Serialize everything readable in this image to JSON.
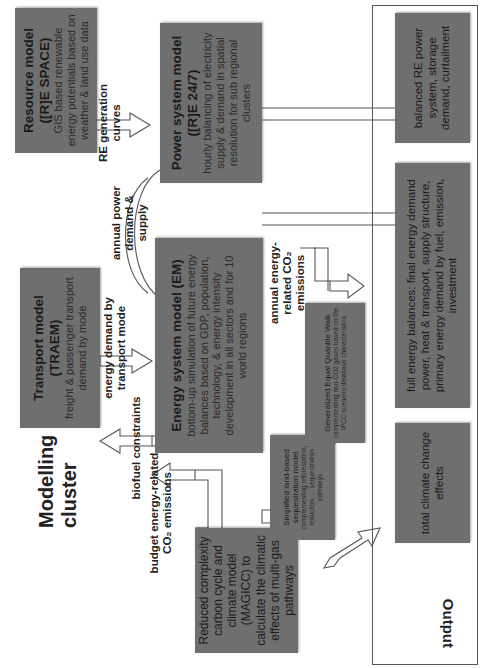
{
  "diagram": {
    "cluster_title": "Modelling cluster",
    "output_label": "Output",
    "models": {
      "resource": {
        "title": "Resource model ([R]E SPACE)",
        "desc": "GIS based renewable energy potentials based on weather & land use data"
      },
      "power": {
        "title": "Power system model ([R]E 24/7)",
        "desc": "hourly balancing of electricity supply & demand in spatial resolution for sub regional clusters"
      },
      "transport": {
        "title": "Transport model (TRAEM)",
        "desc": "freight & passenger transport demand by mode"
      },
      "energy": {
        "title": "Energy system model (EM)",
        "desc": "bottom-up simulation of future energy balances based on GDP, population, technology, & energy intensity development in all sectors and for 10 world regions"
      },
      "magicc": {
        "title": "",
        "desc": "Reduced complexity carbon cycle and climate model (MAGICC) to calculate the climatic effects of multi-gas pathways"
      },
      "land": {
        "title": "Simplified land-based sequestration model",
        "desc": "complementing reforestation, reduction, ... sequestration pathways"
      },
      "quantile": {
        "title": "Generalized Equal Quantile Walk",
        "desc": "complementing non-CO2 gases based on the IPCC scenario database characteristics"
      }
    },
    "outputs": [
      "balanced RE power system, storage demand, curtailment",
      "full energy balances: final energy demand power, heat & transport, supply structure, primary energy demand by fuel, emission, investment",
      "total climate change effects"
    ],
    "flows": {
      "re_curves": "RE generation curves",
      "annual_power": "annual power demand & supply",
      "energy_demand_transport": "energy demand by transport mode",
      "biofuel": "biofuel constraints",
      "budget": "budget energy-related CO₂ emissions",
      "annual_co2": "annual energy-related CO₂ emissions"
    },
    "colors": {
      "box_fill": "#6f6f6f",
      "text": "#1c1c1c",
      "arrow_stroke": "#555555",
      "background": "#ffffff"
    }
  }
}
